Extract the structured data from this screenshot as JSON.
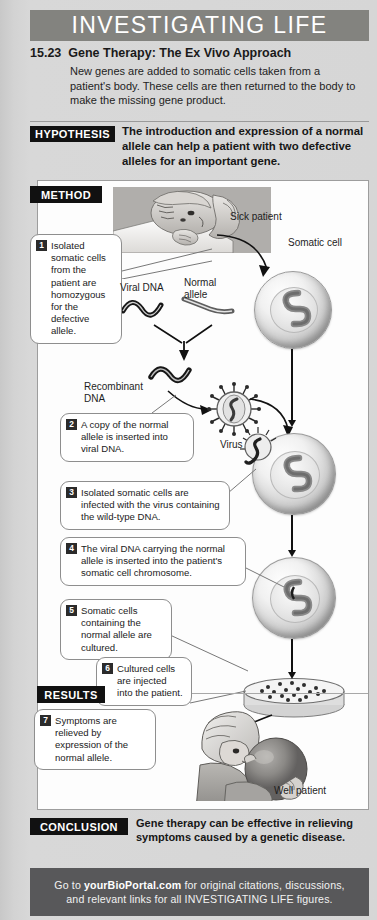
{
  "header": {
    "banner": "INVESTIGATING LIFE",
    "figure_number": "15.23",
    "figure_title": "Gene Therapy: The Ex Vivo Approach",
    "figure_description": "New genes are added to somatic cells taken from a patient's body. These cells are then returned to the body to make the missing gene product."
  },
  "hypothesis": {
    "label": "HYPOTHESIS",
    "text": "The introduction and expression of a normal allele can help a patient with two defective alleles for an important gene."
  },
  "method": {
    "label": "METHOD",
    "steps": [
      {
        "number": "1",
        "text": "Isolated somatic cells from the patient are homozygous for the defective allele."
      },
      {
        "number": "2",
        "text": "A copy of the normal allele is inserted into viral DNA."
      },
      {
        "number": "3",
        "text": "Isolated somatic cells are infected with the virus containing the wild-type DNA."
      },
      {
        "number": "4",
        "text": "The viral DNA carrying the normal allele is inserted into the patient's somatic cell chromosome."
      },
      {
        "number": "5",
        "text": "Somatic cells containing the normal allele are cultured."
      },
      {
        "number": "6",
        "text": "Cultured cells are injected into the patient."
      }
    ],
    "labels": {
      "sick_patient": "Sick patient",
      "somatic_cell": "Somatic cell",
      "viral_dna": "Viral DNA",
      "normal_allele": "Normal allele",
      "recombinant_dna": "Recombinant DNA",
      "virus": "Virus",
      "well_patient": "Well patient"
    }
  },
  "results": {
    "label": "RESULTS",
    "steps": [
      {
        "number": "7",
        "text": "Symptoms are relieved by expression of the normal allele."
      }
    ]
  },
  "conclusion": {
    "label": "CONCLUSION",
    "text": "Gene therapy can be effective in relieving symptoms caused by a genetic disease."
  },
  "footer": {
    "line1_pre": "Go to ",
    "site": "yourBioPortal.com",
    "line1_post": " for original citations, discussions,",
    "line2": "and relevant links for all INVESTIGATING LIFE figures."
  },
  "colors": {
    "banner_bg": "#83837f",
    "chip_bg": "#111111",
    "footer_bg": "#58585a",
    "page_bg": "#d6d6d6",
    "panel_bg": "#fdfdfd"
  }
}
